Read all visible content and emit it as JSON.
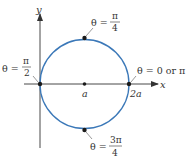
{
  "diagram": {
    "type": "polar-circle",
    "equation_description": "circle r = 2a cos(theta) passing through origin, centered at (a, 0)",
    "colors": {
      "curve": "#3b78b8",
      "axis": "#333333",
      "point": "#1a1a1a",
      "text": "#333333"
    },
    "axes": {
      "x_label": "x",
      "y_label": "y"
    },
    "axis_ticks": {
      "center_label": "a",
      "right_label": "2a"
    },
    "points": [
      {
        "name": "origin",
        "label_prefix": "θ =",
        "num": "π",
        "den": "2"
      },
      {
        "name": "right",
        "label": "θ = 0 or π"
      },
      {
        "name": "top",
        "label_prefix": "θ =",
        "num": "π",
        "den": "4"
      },
      {
        "name": "bottom",
        "label_prefix": "θ =",
        "num": "3π",
        "den": "4"
      },
      {
        "name": "center",
        "label": "a"
      }
    ]
  }
}
